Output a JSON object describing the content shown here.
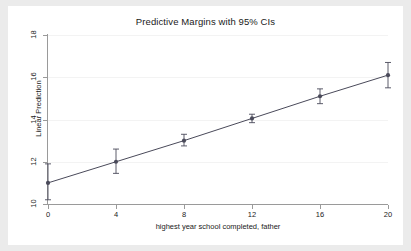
{
  "figure": {
    "background_color": "#ebebeb",
    "plot_background_color": "#ffffff",
    "axis_color": "#9a9a9a",
    "series_color": "#4a4a5a"
  },
  "chart_data": {
    "type": "line",
    "title": "Predictive Margins with 95% CIs",
    "xlabel": "highest year school completed, father",
    "ylabel": "Linear Prediction",
    "x": [
      0,
      4,
      8,
      12,
      16,
      20
    ],
    "values": [
      11.0,
      12.0,
      13.0,
      14.05,
      15.1,
      16.1
    ],
    "ci_low": [
      10.2,
      11.45,
      12.75,
      13.85,
      14.75,
      15.5
    ],
    "ci_high": [
      11.9,
      12.6,
      13.3,
      14.25,
      15.45,
      16.7
    ],
    "xlim": [
      0,
      20
    ],
    "ylim": [
      10,
      18
    ],
    "xticks": [
      0,
      4,
      8,
      12,
      16,
      20
    ],
    "yticks": [
      10,
      12,
      14,
      16,
      18
    ],
    "xticklabels": [
      "0",
      "4",
      "8",
      "12",
      "16",
      "20"
    ],
    "yticklabels": [
      "10",
      "12",
      "14",
      "16",
      "18"
    ],
    "grid": true,
    "grid_axis": "y",
    "legend": null,
    "marker": "circle",
    "error_bars": "95% CI"
  }
}
